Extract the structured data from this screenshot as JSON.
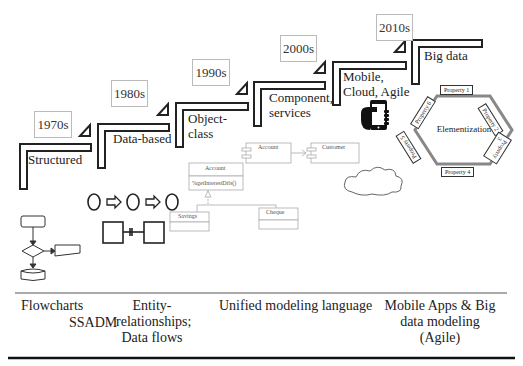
{
  "eras": [
    {
      "year": "1970s",
      "label": "Structured"
    },
    {
      "year": "1980s",
      "label": "Data-based"
    },
    {
      "year": "1990s",
      "label": "Object-\nclass"
    },
    {
      "year": "2000s",
      "label": "Component,\nservices"
    },
    {
      "year": "2010s",
      "label_mobile": "Mobile,\nCloud, Agile",
      "label": "Big data"
    }
  ],
  "elementization": {
    "center": "Elementization",
    "properties": [
      "Property 1",
      "Property 2",
      "Property 3",
      "Property 4",
      "Property 5",
      "Property 6"
    ]
  },
  "uml": {
    "class_name": "Account",
    "method": "%getInterestDtls()",
    "subclasses": [
      "Savings",
      "Cheque"
    ],
    "components": [
      "Account",
      "Customer"
    ]
  },
  "bottom": {
    "flowcharts": "Flowcharts",
    "ssadm": "SSADM",
    "er": "Entity-\nrelationships;\nData flows",
    "uml": "Unified modeling language",
    "mobile": "Mobile Apps & Big\ndata modeling\n(Agile)"
  }
}
